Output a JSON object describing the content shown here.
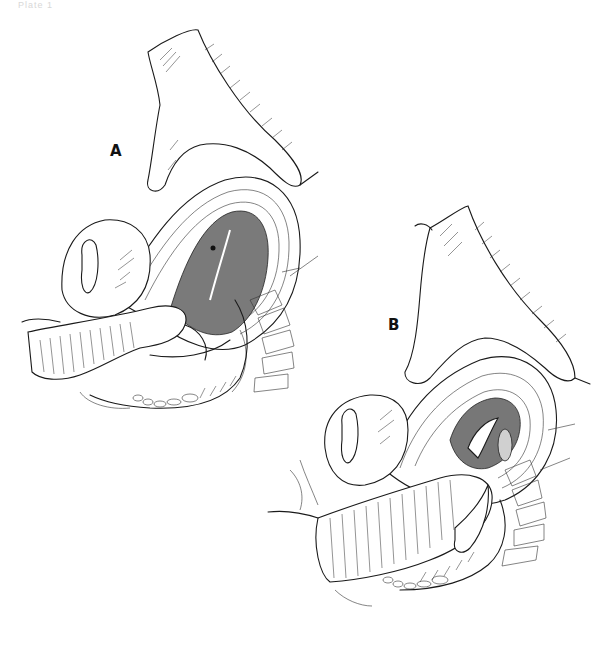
{
  "figure": {
    "caption": "Plate 1",
    "panels": [
      {
        "label": "A",
        "description": "Bimanual manipulation: external hand on abdomen over uterus, internal hand/forearm in vagina"
      },
      {
        "label": "B",
        "description": "Second stage of bimanual manipulation: forearm advanced, uterus compressed between hands"
      }
    ],
    "style": {
      "line_color": "#1a1a1a",
      "background": "#ffffff"
    }
  }
}
